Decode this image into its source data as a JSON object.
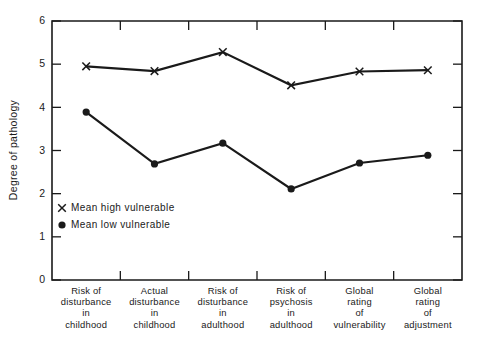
{
  "chart_data": {
    "type": "line",
    "title": "",
    "xlabel": "",
    "ylabel": "Degree of pathology",
    "ylim": [
      0,
      6
    ],
    "yticks": [
      0,
      1,
      2,
      3,
      4,
      5,
      6
    ],
    "grid": false,
    "legend_position": "inside-lower-left",
    "categories": [
      "Risk of disturbance in childhood",
      "Actual disturbance in childhood",
      "Risk of disturbance in adulthood",
      "Risk of psychosis in adulthood",
      "Global rating of vulnerability",
      "Global rating of adjustment"
    ],
    "category_lines": [
      [
        "Risk of",
        "disturbance",
        "in",
        "childhood"
      ],
      [
        "Actual",
        "disturbance",
        "in",
        "childhood"
      ],
      [
        "Risk of",
        "disturbance",
        "in",
        "adulthood"
      ],
      [
        "Risk of",
        "psychosis",
        "in",
        "adulthood"
      ],
      [
        "Global",
        "rating",
        "of",
        "vulnerability"
      ],
      [
        "Global",
        "rating",
        "of",
        "adjustment"
      ]
    ],
    "series": [
      {
        "name": "Mean high vulnerable",
        "marker": "x",
        "color": "#1a1a1a",
        "values": [
          4.95,
          4.84,
          5.28,
          4.51,
          4.83,
          4.86
        ]
      },
      {
        "name": "Mean low vulnerable",
        "marker": "circle",
        "color": "#1a1a1a",
        "values": [
          3.89,
          2.69,
          3.17,
          2.11,
          2.71,
          2.89
        ]
      }
    ]
  },
  "legend": {
    "entries": [
      {
        "marker": "x",
        "label": "Mean high vulnerable"
      },
      {
        "marker": "circle",
        "label": "Mean low vulnerable"
      }
    ]
  },
  "axis": {
    "y_tick_labels": [
      "0",
      "1",
      "2",
      "3",
      "4",
      "5",
      "6"
    ],
    "y_axis_title": "Degree of pathology"
  }
}
